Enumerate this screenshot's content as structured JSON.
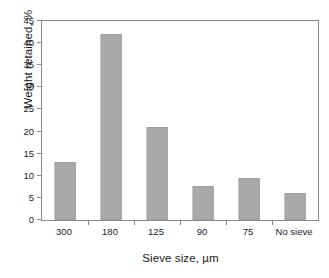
{
  "chart_data": {
    "type": "bar",
    "title": "",
    "subtitle": "",
    "xlabel": "Sieve size, µm",
    "ylabel": "Weight retained, %",
    "categories": [
      "300",
      "180",
      "125",
      "90",
      "75",
      "No sieve"
    ],
    "values": [
      13.2,
      42.0,
      21.0,
      7.7,
      9.6,
      6.0
    ],
    "series": [
      {
        "name": "Weight retained",
        "values": [
          13.2,
          42.0,
          21.0,
          7.7,
          9.6,
          6.0
        ]
      }
    ],
    "ylim": [
      0,
      45
    ],
    "ytick_step": 5,
    "yticks": [
      0,
      5,
      10,
      15,
      20,
      25,
      30,
      35,
      40,
      45
    ],
    "ytick_labels": [
      "0",
      "5",
      "10",
      "15",
      "20",
      "25",
      "30",
      "35",
      "40",
      "45"
    ],
    "grid": false,
    "legend": false,
    "legend_position": "none",
    "frame": "box",
    "bar_color": "#a9a9a9",
    "bar_edge_color": "#9e9e9e",
    "axis_color": "#8a8a8a",
    "background_color": "#ffffff",
    "annotations": []
  }
}
